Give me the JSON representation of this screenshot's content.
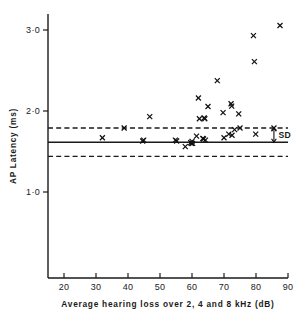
{
  "chart_data": {
    "type": "scatter",
    "title": "",
    "xlabel": "Average hearing loss over 2, 4 and 8 kHz (dB)",
    "ylabel": "AP Latency (ms)",
    "xlim": [
      15,
      90
    ],
    "ylim": [
      0.62,
      3.17
    ],
    "xticks": [
      20,
      30,
      40,
      50,
      60,
      70,
      80,
      90
    ],
    "xticklabels": [
      "20",
      "30",
      "40",
      "50",
      "60",
      "70",
      "80",
      "90"
    ],
    "yticks": [
      1.0,
      2.0,
      3.0
    ],
    "yticklabels": [
      "1·0",
      "2·0",
      "3·0"
    ],
    "grid": false,
    "legend": null,
    "annotations": [
      {
        "text": "SD",
        "x": 88.5,
        "y": 1.66,
        "kind": "sd-bracket-label"
      }
    ],
    "reference_lines": [
      {
        "name": "mean",
        "style": "solid",
        "y": 1.615
      },
      {
        "name": "mean-plus-sd",
        "style": "dashed",
        "y": 1.79
      },
      {
        "name": "mean-minus-sd",
        "style": "dashed",
        "y": 1.44
      }
    ],
    "marker": "x",
    "series": [
      {
        "name": "subjects",
        "points": [
          [
            32.0,
            1.67
          ],
          [
            38.8,
            1.79
          ],
          [
            44.6,
            1.63
          ],
          [
            44.9,
            1.64
          ],
          [
            46.8,
            1.93
          ],
          [
            54.8,
            1.64
          ],
          [
            55.2,
            1.63
          ],
          [
            57.9,
            1.56
          ],
          [
            59.6,
            1.61
          ],
          [
            59.8,
            1.6
          ],
          [
            60.0,
            1.625
          ],
          [
            60.2,
            1.6
          ],
          [
            61.4,
            1.69
          ],
          [
            62.0,
            2.16
          ],
          [
            62.3,
            1.905
          ],
          [
            63.4,
            1.66
          ],
          [
            63.6,
            1.655
          ],
          [
            63.8,
            1.915
          ],
          [
            64.0,
            1.905
          ],
          [
            64.2,
            1.64
          ],
          [
            65.0,
            2.055
          ],
          [
            67.9,
            2.375
          ],
          [
            69.7,
            1.98
          ],
          [
            70.0,
            1.67
          ],
          [
            71.5,
            1.715
          ],
          [
            72.2,
            2.09
          ],
          [
            72.4,
            2.06
          ],
          [
            72.5,
            1.7
          ],
          [
            73.3,
            1.77
          ],
          [
            74.6,
            1.965
          ],
          [
            75.0,
            1.79
          ],
          [
            79.2,
            2.93
          ],
          [
            79.5,
            2.61
          ],
          [
            79.9,
            1.715
          ],
          [
            85.6,
            1.79
          ],
          [
            87.5,
            3.055
          ]
        ]
      }
    ]
  }
}
